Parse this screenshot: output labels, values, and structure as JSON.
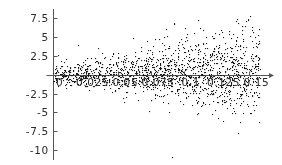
{
  "chart_data": {
    "type": "scatter",
    "title": "",
    "subtitle": "",
    "xlabel": "",
    "ylabel": "",
    "grid": false,
    "legend": false,
    "legend_position": "none",
    "axis_style": "mathematica-crossing-axes",
    "x_axis_arrow": true,
    "point_color": "#1a1a1a",
    "point_size_px": 1.1,
    "axis_color": "#555555",
    "background": "#ffffff",
    "xlim": [
      -0.004,
      0.1665
    ],
    "ylim": [
      -11.2,
      8.6
    ],
    "xticks": [
      0,
      0.025,
      0.05,
      0.075,
      0.1,
      0.125,
      0.15
    ],
    "xtick_labels": [
      "0",
      "0.025",
      "0.05",
      "0.075",
      "0.1",
      "0.125",
      "0.15"
    ],
    "yticks": [
      7.5,
      5,
      2.5,
      -2.5,
      -5,
      -7.5,
      -10
    ],
    "ytick_labels": [
      "7.5",
      "5",
      "2.5",
      "-2.5",
      "-5",
      "-7.5",
      "-10"
    ],
    "y_zero_tick_labeled": false,
    "n_points": 1500,
    "generator": {
      "mode": "heteroscedastic_residuals",
      "seed": 20240517,
      "x_min": 0.0,
      "x_max": 0.158,
      "x_density_exponent": 0.82,
      "sigma_base": 0.62,
      "sigma_growth": 19.0,
      "sigma_growth_exponent": 1.25,
      "mean_offset": 0.18,
      "skew": 0.22,
      "outlier_fraction": 0.035,
      "outlier_scale": 2.15
    }
  }
}
